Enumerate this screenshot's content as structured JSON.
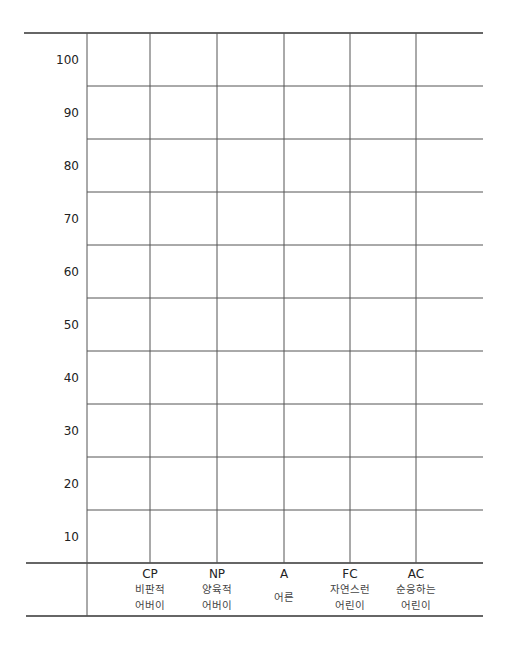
{
  "chart_data": {
    "type": "bar",
    "title": "",
    "xlabel": "",
    "ylabel": "",
    "ylim": [
      5,
      105
    ],
    "yticks": [
      100,
      90,
      80,
      70,
      60,
      50,
      40,
      30,
      20,
      10
    ],
    "grid": true,
    "categories": [
      {
        "code": "CP",
        "sub": [
          "비판적",
          "어버이"
        ]
      },
      {
        "code": "NP",
        "sub": [
          "양육적",
          "어버이"
        ]
      },
      {
        "code": "A",
        "sub": [
          "어른"
        ]
      },
      {
        "code": "FC",
        "sub": [
          "자연스런",
          "어린이"
        ]
      },
      {
        "code": "AC",
        "sub": [
          "순응하는",
          "어린이"
        ]
      }
    ],
    "series": []
  }
}
